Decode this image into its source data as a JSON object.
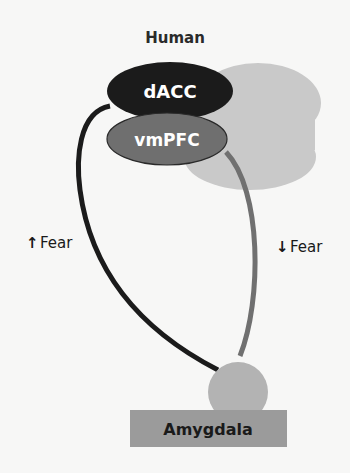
{
  "title": "Human",
  "regions": {
    "dacc": {
      "label": "dACC",
      "fill": "#1b1b1b",
      "text_color": "#ffffff"
    },
    "vmpfc": {
      "label": "vmPFC",
      "fill": "#6f6f6f",
      "text_color": "#ffffff"
    },
    "cortex_background": {
      "fill": "#c9c9c9"
    },
    "amygdala": {
      "label": "Amygdala",
      "circle_fill": "#b3b3b3",
      "box_fill": "#9b9b9b",
      "text_color": "#1a1a1a"
    }
  },
  "pathways": {
    "dacc_to_amygdala": {
      "label": "Fear",
      "direction": "up",
      "arrow_glyph": "↑",
      "color": "#1b1b1b"
    },
    "vmpfc_to_amygdala": {
      "label": "Fear",
      "direction": "down",
      "arrow_glyph": "↓",
      "color": "#707070"
    }
  }
}
